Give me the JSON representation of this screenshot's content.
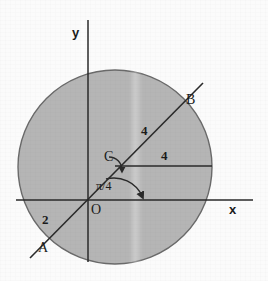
{
  "figure": {
    "type": "geometry-diagram",
    "background_color": "#fbfbfb",
    "ink_color": "#2a2a2a",
    "disk_fill_color": "#b5b5b5",
    "disk_stroke_color": "#6a6a6a"
  },
  "axes": {
    "x_label": "x",
    "y_label": "y",
    "origin_label": "O",
    "x_axis": {
      "x1": 16,
      "y1": 200,
      "x2": 253,
      "y2": 200
    },
    "y_axis": {
      "x1": 88,
      "y1": 20,
      "x2": 88,
      "y2": 262
    },
    "x_label_pos": {
      "x": 229,
      "y": 203
    },
    "y_label_pos": {
      "x": 72,
      "y": 26
    },
    "origin_label_pos": {
      "x": 91,
      "y": 203
    }
  },
  "circle": {
    "center": {
      "x": 115,
      "y": 167
    },
    "radius": 97,
    "fill": "#b5b5b5",
    "stroke": "#6a6a6a"
  },
  "chord_line": {
    "from": {
      "x": 30,
      "y": 258
    },
    "to": {
      "x": 203,
      "y": 83
    },
    "angle_label": "π/4",
    "angle_label_pos": {
      "x": 96,
      "y": 180
    }
  },
  "horizontal_segment": {
    "from": {
      "x": 115,
      "y": 166
    },
    "to": {
      "x": 212,
      "y": 166
    }
  },
  "points": [
    {
      "name": "point-a",
      "label": "A",
      "x": 45,
      "y": 248,
      "label_pos": {
        "x": 38,
        "y": 241
      }
    },
    {
      "name": "point-b",
      "label": "B",
      "x": 188,
      "y": 101,
      "label_pos": {
        "x": 186,
        "y": 93
      }
    },
    {
      "name": "point-c",
      "label": "C",
      "x": 115,
      "y": 166,
      "label_pos": {
        "x": 104,
        "y": 150
      }
    },
    {
      "name": "point-o",
      "label": "O",
      "x": 88,
      "y": 200,
      "label_pos": {
        "x": 91,
        "y": 203
      }
    }
  ],
  "measurements": [
    {
      "name": "length-oa",
      "label": "2",
      "x": 42,
      "y": 213
    },
    {
      "name": "length-cb",
      "label": "4",
      "x": 141,
      "y": 124
    },
    {
      "name": "length-c-horizontal",
      "label": "4",
      "x": 161,
      "y": 149
    }
  ],
  "angle_arc": {
    "label": "π/4",
    "center": {
      "x": 115,
      "y": 166
    },
    "note": "arc with arrowhead sweeping from the chord down toward the horizontal"
  }
}
